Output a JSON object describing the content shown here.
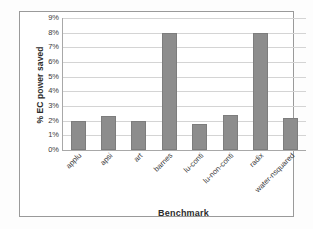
{
  "chart_data": {
    "type": "bar",
    "title": "",
    "xlabel": "Benchmark",
    "ylabel": "% EC power saved",
    "categories": [
      "applu",
      "apsi",
      "art",
      "barnes",
      "lu-conti",
      "lu-non-conti",
      "radix",
      "water-nsquared"
    ],
    "values": [
      2.0,
      2.3,
      1.95,
      7.95,
      1.75,
      2.4,
      7.95,
      2.15
    ],
    "ylim": [
      0,
      9
    ],
    "ytick_labels": [
      "0%",
      "1%",
      "2%",
      "3%",
      "4%",
      "5%",
      "6%",
      "7%",
      "8%",
      "9%"
    ],
    "ytick_values": [
      0,
      1,
      2,
      3,
      4,
      5,
      6,
      7,
      8,
      9
    ],
    "grid": true,
    "legend": "none",
    "bar_color": "#8d8d8d",
    "gridline_color": "#d4d4d4",
    "axis_color": "#a8a8a8",
    "frame_color": "#9a9a9a",
    "background_color": "#ffffff"
  }
}
